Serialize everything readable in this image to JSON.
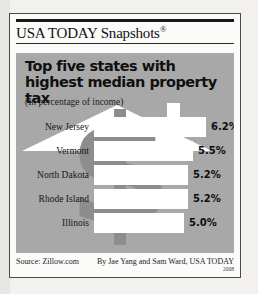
{
  "masthead": {
    "brand": "USA TODAY Snapshots",
    "registered_mark": "®"
  },
  "panel": {
    "headline": "Top five states with highest median property tax",
    "subhead": "(In percentage of income)",
    "background_color": "#a8a8a8",
    "bar_color": "#ffffff",
    "artwork": [
      "house-icon",
      "dollar-sign-icon"
    ]
  },
  "footer": {
    "source": "Source: Zillow.com",
    "byline": "By Jae Yang and Sam Ward, USA TODAY",
    "year": "2008"
  },
  "chart_data": {
    "type": "bar",
    "orientation": "horizontal",
    "title": "Top five states with highest median property tax",
    "subtitle": "(In percentage of income)",
    "xlabel": "",
    "ylabel": "",
    "unit": "%",
    "xlim": [
      0,
      6.2
    ],
    "grid": false,
    "legend": null,
    "categories": [
      "New Jersey",
      "Vermont",
      "North Dakota",
      "Rhode Island",
      "Illinois"
    ],
    "values": [
      6.2,
      5.5,
      5.2,
      5.2,
      5.0
    ],
    "labels": [
      "6.2%",
      "5.5%",
      "5.2%",
      "5.2%",
      "5.0%"
    ],
    "source": "Zillow.com"
  }
}
